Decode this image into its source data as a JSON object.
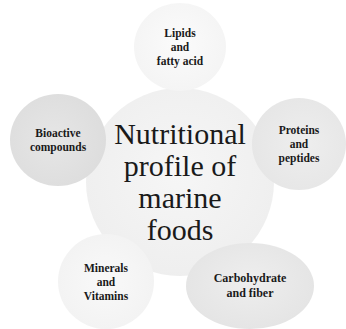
{
  "diagram": {
    "type": "radial-hub",
    "center": {
      "label": "Nutritional profile of marine foods",
      "lines": [
        "Nutritional",
        "profile of",
        "marine",
        "foods"
      ]
    },
    "satellites": [
      {
        "id": "lipids",
        "lines": [
          "Lipids",
          "and",
          "fatty acid"
        ],
        "position": "top"
      },
      {
        "id": "proteins",
        "lines": [
          "Proteins",
          "and",
          "peptides"
        ],
        "position": "right"
      },
      {
        "id": "carbohydrate",
        "lines": [
          "Carbohydrate",
          "and fiber"
        ],
        "position": "bottom-right"
      },
      {
        "id": "minerals",
        "lines": [
          "Minerals",
          "and",
          "Vitamins"
        ],
        "position": "bottom-left"
      },
      {
        "id": "bioactive",
        "lines": [
          "Bioactive",
          "compounds"
        ],
        "position": "left"
      }
    ],
    "colors": {
      "background": "#ffffff",
      "center_fill": "#efefef",
      "satellite_fill": "#e6e6e6",
      "text": "#1a1a1a"
    }
  }
}
